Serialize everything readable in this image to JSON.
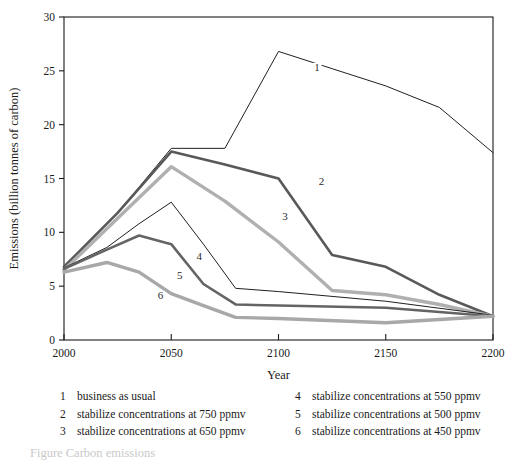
{
  "chart_data": {
    "type": "line",
    "title": "",
    "xlabel": "Year",
    "ylabel": "Emissions (billion tonnes of carbon)",
    "xlim": [
      2000,
      2200
    ],
    "ylim": [
      0,
      30
    ],
    "xticks": [
      2000,
      2050,
      2100,
      2150,
      2200
    ],
    "yticks": [
      0,
      5,
      10,
      15,
      20,
      25,
      30
    ],
    "grid": false,
    "legend_position": "below-plot",
    "series": [
      {
        "name": "1",
        "label": "business as usual",
        "color": "#1f1f1f",
        "width": 1.0,
        "x": [
          2000,
          2025,
          2050,
          2075,
          2100,
          2125,
          2150,
          2175,
          2200
        ],
        "values": [
          6.8,
          11.8,
          17.8,
          17.8,
          26.8,
          25.2,
          23.6,
          21.6,
          17.4
        ]
      },
      {
        "name": "2",
        "label": "stabilize concentrations at 750 ppmv",
        "color": "#595959",
        "width": 2.6,
        "x": [
          2000,
          2025,
          2050,
          2075,
          2100,
          2125,
          2150,
          2175,
          2200
        ],
        "values": [
          6.8,
          11.8,
          17.5,
          16.3,
          15.0,
          7.9,
          6.8,
          4.2,
          2.2
        ]
      },
      {
        "name": "3",
        "label": "stabilize concentrations at 650 ppmv",
        "color": "#b0b0b0",
        "width": 3.4,
        "x": [
          2000,
          2025,
          2050,
          2075,
          2100,
          2125,
          2150,
          2175,
          2200
        ],
        "values": [
          6.5,
          11.3,
          16.1,
          12.9,
          9.1,
          4.6,
          4.2,
          3.3,
          2.2
        ]
      },
      {
        "name": "4",
        "label": "stabilize concentrations at 550 ppmv",
        "color": "#1f1f1f",
        "width": 1.0,
        "x": [
          2000,
          2020,
          2035,
          2050,
          2065,
          2080,
          2100,
          2150,
          2200
        ],
        "values": [
          6.7,
          8.6,
          10.8,
          12.8,
          8.9,
          4.8,
          4.5,
          3.6,
          2.3
        ]
      },
      {
        "name": "5",
        "label": "stabilize concentrations at 500 ppmv",
        "color": "#646464",
        "width": 2.6,
        "x": [
          2000,
          2020,
          2035,
          2050,
          2065,
          2080,
          2100,
          2150,
          2200
        ],
        "values": [
          6.6,
          8.4,
          9.7,
          8.9,
          5.2,
          3.3,
          3.2,
          3.0,
          2.2
        ]
      },
      {
        "name": "6",
        "label": "stabilize concentrations at 450 ppmv",
        "color": "#a8a8a8",
        "width": 3.4,
        "x": [
          2000,
          2020,
          2035,
          2050,
          2065,
          2080,
          2100,
          2150,
          2200
        ],
        "values": [
          6.3,
          7.2,
          6.3,
          4.3,
          3.2,
          2.1,
          2.0,
          1.6,
          2.2
        ]
      }
    ],
    "series_labels": [
      {
        "name": "1",
        "text": "1",
        "x": 2118,
        "y": 25.0
      },
      {
        "name": "2",
        "text": "2",
        "x": 2120,
        "y": 14.4
      },
      {
        "name": "3",
        "text": "3",
        "x": 2103,
        "y": 11.1
      },
      {
        "name": "4",
        "text": "4",
        "x": 2063,
        "y": 7.4
      },
      {
        "name": "5",
        "text": "5",
        "x": 2054,
        "y": 5.7
      },
      {
        "name": "6",
        "text": "6",
        "x": 2045,
        "y": 3.8
      }
    ]
  },
  "legend": {
    "left_column": [
      {
        "key": "1",
        "text": "business as usual"
      },
      {
        "key": "2",
        "text": "stabilize concentrations at 750 ppmv"
      },
      {
        "key": "3",
        "text": "stabilize concentrations at 650 ppmv"
      }
    ],
    "right_column": [
      {
        "key": "4",
        "text": "stabilize concentrations at 550 ppmv"
      },
      {
        "key": "5",
        "text": "stabilize concentrations at 500 ppmv"
      },
      {
        "key": "6",
        "text": "stabilize concentrations at 450 ppmv"
      }
    ]
  },
  "caption": {
    "fragment": "Figure    Carbon    emissions"
  }
}
